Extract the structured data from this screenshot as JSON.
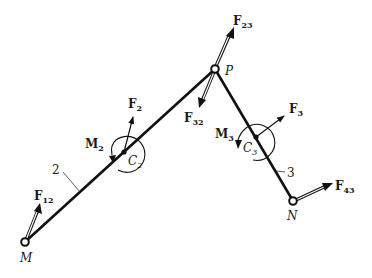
{
  "points": {
    "M": {
      "label": "M",
      "x": 25,
      "y": 242
    },
    "P": {
      "label": "P",
      "x": 215,
      "y": 69
    },
    "N": {
      "label": "N",
      "x": 293,
      "y": 201
    },
    "C2": {
      "label": "C",
      "sub": "2",
      "x": 124,
      "y": 152
    },
    "C3": {
      "label": "C",
      "sub": "3",
      "x": 256,
      "y": 137
    }
  },
  "links": [
    {
      "id": "2",
      "label": "2",
      "from": "M",
      "to": "P"
    },
    {
      "id": "3",
      "label": "3",
      "from": "P",
      "to": "N"
    }
  ],
  "forces": [
    {
      "id": "F12",
      "label": "F",
      "sub": "12",
      "at": "M",
      "style": "double"
    },
    {
      "id": "F23",
      "label": "F",
      "sub": "23",
      "at": "P",
      "style": "double"
    },
    {
      "id": "F32",
      "label": "F",
      "sub": "32",
      "at": "P",
      "style": "double"
    },
    {
      "id": "F43",
      "label": "F",
      "sub": "43",
      "at": "N",
      "style": "double"
    },
    {
      "id": "F2",
      "label": "F",
      "sub": "2",
      "at": "C2",
      "style": "single"
    },
    {
      "id": "F3",
      "label": "F",
      "sub": "3",
      "at": "C3",
      "style": "single"
    }
  ],
  "moments": [
    {
      "id": "M2",
      "label": "M",
      "sub": "2",
      "at": "C2"
    },
    {
      "id": "M3",
      "label": "M",
      "sub": "3",
      "at": "C3"
    }
  ],
  "colors": {
    "ink": "#111111",
    "background": "#ffffff"
  }
}
